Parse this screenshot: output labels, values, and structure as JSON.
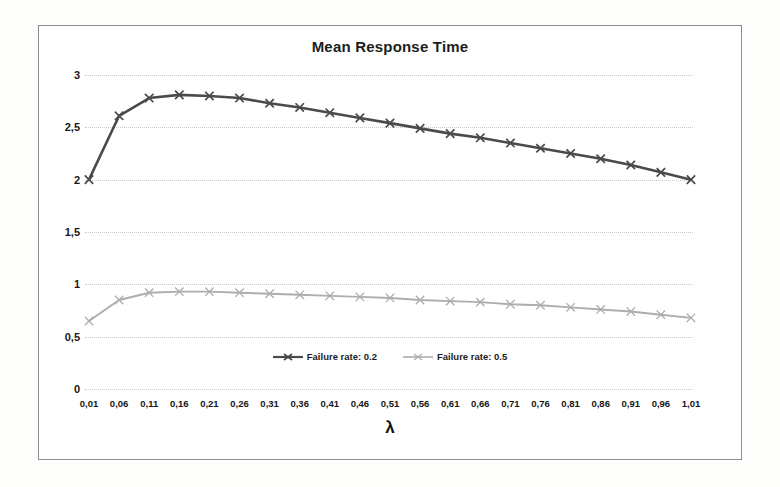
{
  "figure": {
    "title": "Mean Response Time",
    "x_axis_title": "λ"
  },
  "chart_data": {
    "type": "line",
    "title": "Mean Response Time",
    "subtitle": "",
    "xlabel": "λ",
    "ylabel": "",
    "grid": true,
    "legend_position": "bottom-center",
    "xlim": [
      0.01,
      1.01
    ],
    "ylim": [
      0,
      3
    ],
    "ytick_labels": [
      "0",
      "0,5",
      "1",
      "1,5",
      "2",
      "2,5",
      "3"
    ],
    "ytick_values": [
      0,
      0.5,
      1,
      1.5,
      2,
      2.5,
      3
    ],
    "categories": [
      "0,01",
      "0,06",
      "0,11",
      "0,16",
      "0,21",
      "0,26",
      "0,31",
      "0,36",
      "0,41",
      "0,46",
      "0,51",
      "0,56",
      "0,61",
      "0,66",
      "0,71",
      "0,76",
      "0,81",
      "0,86",
      "0,91",
      "0,96",
      "1,01"
    ],
    "x": [
      0.01,
      0.06,
      0.11,
      0.16,
      0.21,
      0.26,
      0.31,
      0.36,
      0.41,
      0.46,
      0.51,
      0.56,
      0.61,
      0.66,
      0.71,
      0.76,
      0.81,
      0.86,
      0.91,
      0.96,
      1.01
    ],
    "series": [
      {
        "name": "Failure rate: 0.2",
        "color": "#4a4a4a",
        "marker": "x",
        "values": [
          2.0,
          2.61,
          2.78,
          2.81,
          2.8,
          2.78,
          2.73,
          2.69,
          2.64,
          2.59,
          2.54,
          2.49,
          2.44,
          2.4,
          2.35,
          2.3,
          2.25,
          2.2,
          2.14,
          2.07,
          2.0
        ]
      },
      {
        "name": "Failure rate: 0.5",
        "color": "#adadad",
        "marker": "x",
        "values": [
          0.65,
          0.85,
          0.92,
          0.93,
          0.93,
          0.92,
          0.91,
          0.9,
          0.89,
          0.88,
          0.87,
          0.85,
          0.84,
          0.83,
          0.81,
          0.8,
          0.78,
          0.76,
          0.74,
          0.71,
          0.68
        ]
      }
    ],
    "annotations": []
  },
  "legend": {
    "items": [
      {
        "label": "Failure rate: 0.2",
        "color": "#4a4a4a"
      },
      {
        "label": "Failure rate: 0.5",
        "color": "#adadad"
      }
    ]
  },
  "colors": {
    "series_dark": "#4a4a4a",
    "series_light": "#adadad",
    "grid": "#c9c9c9",
    "frame": "#8d8d8d",
    "text": "#171717"
  }
}
